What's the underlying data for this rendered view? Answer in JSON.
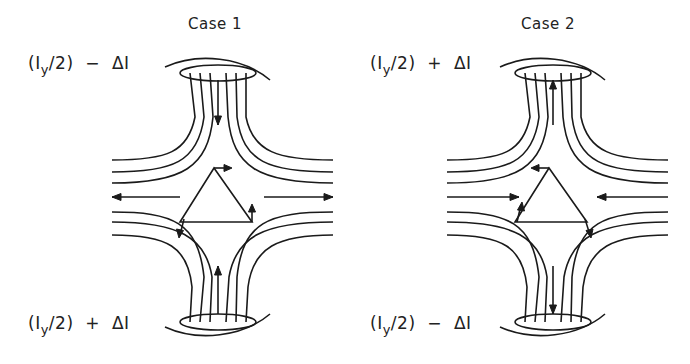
{
  "figure": {
    "panels": [
      {
        "id": "case1",
        "title": "Case 1",
        "top_label": {
          "prefix": "(I",
          "sub": "y",
          "suffix": "/2)  −  ΔI"
        },
        "bottom_label": {
          "prefix": "(I",
          "sub": "y",
          "suffix": "/2)  +  ΔI"
        },
        "vertical_flow": "down-top / up-bottom (converging)",
        "horizontal_flow": "outward"
      },
      {
        "id": "case2",
        "title": "Case 2",
        "top_label": {
          "prefix": "(I",
          "sub": "y",
          "suffix": "/2)  +  ΔI"
        },
        "bottom_label": {
          "prefix": "(I",
          "sub": "y",
          "suffix": "/2)  −  ΔI"
        },
        "vertical_flow": "up-top / down-bottom (diverging)",
        "horizontal_flow": "inward"
      }
    ],
    "colors": {
      "ink": "#1a1a1a",
      "background": "#ffffff"
    }
  }
}
